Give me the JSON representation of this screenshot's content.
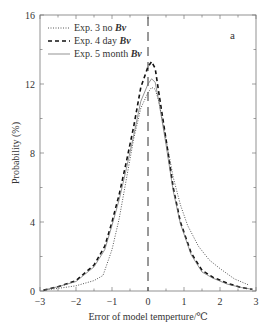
{
  "chart_data": {
    "type": "line",
    "title": "",
    "panel_label": "a",
    "xlabel": "Error of model temperture/℃",
    "ylabel": "Probability (%)",
    "xlim": [
      -3,
      3
    ],
    "ylim": [
      0,
      16
    ],
    "xticks": [
      -3,
      -2,
      -1,
      0,
      1,
      2,
      3
    ],
    "xtick_labels": [
      "−3",
      "−2",
      "−1",
      "0",
      "1",
      "2",
      "3"
    ],
    "yticks": [
      0,
      4,
      8,
      12,
      16
    ],
    "ytick_labels": [
      "0",
      "4",
      "8",
      "12",
      "16"
    ],
    "grid": false,
    "legend_position": "upper left",
    "reference_line": {
      "x": 0,
      "style": "long-dash"
    },
    "series": [
      {
        "name": "Exp. 3 no Bv",
        "style": "dotted",
        "x": [
          -2.9,
          -2.5,
          -2.0,
          -1.5,
          -1.25,
          -1.0,
          -0.8,
          -0.6,
          -0.4,
          -0.2,
          0.0,
          0.1,
          0.2,
          0.3,
          0.5,
          0.7,
          0.9,
          1.1,
          1.4,
          1.7,
          2.0,
          2.4,
          2.8
        ],
        "y": [
          0.05,
          0.15,
          0.3,
          0.6,
          0.9,
          2.4,
          4.2,
          6.5,
          8.8,
          10.6,
          11.5,
          11.8,
          11.7,
          11.0,
          8.8,
          6.6,
          5.0,
          3.8,
          2.6,
          1.8,
          1.3,
          0.7,
          0.35
        ]
      },
      {
        "name": "Exp. 4 day Bv",
        "style": "dashed",
        "x": [
          -2.9,
          -2.5,
          -2.0,
          -1.5,
          -1.2,
          -1.0,
          -0.8,
          -0.6,
          -0.4,
          -0.2,
          0.0,
          0.1,
          0.2,
          0.3,
          0.5,
          0.7,
          0.9,
          1.2,
          1.5,
          1.8,
          2.2,
          2.6,
          2.9
        ],
        "y": [
          0.05,
          0.25,
          0.6,
          1.5,
          2.6,
          4.0,
          5.6,
          7.5,
          9.5,
          11.8,
          13.0,
          13.3,
          12.9,
          11.5,
          8.8,
          6.0,
          4.0,
          2.2,
          1.2,
          0.8,
          0.45,
          0.2,
          0.1
        ]
      },
      {
        "name": "Exp. 5 month Bv",
        "style": "solid",
        "x": [
          -2.9,
          -2.5,
          -2.0,
          -1.5,
          -1.2,
          -1.0,
          -0.8,
          -0.6,
          -0.4,
          -0.2,
          0.0,
          0.1,
          0.2,
          0.3,
          0.5,
          0.7,
          0.9,
          1.2,
          1.5,
          1.8,
          2.2,
          2.6,
          2.9
        ],
        "y": [
          0.05,
          0.25,
          0.55,
          1.4,
          2.4,
          3.8,
          5.3,
          7.1,
          9.0,
          11.0,
          12.0,
          12.3,
          12.1,
          11.0,
          8.5,
          5.8,
          3.9,
          2.1,
          1.1,
          0.75,
          0.4,
          0.2,
          0.1
        ]
      }
    ]
  }
}
